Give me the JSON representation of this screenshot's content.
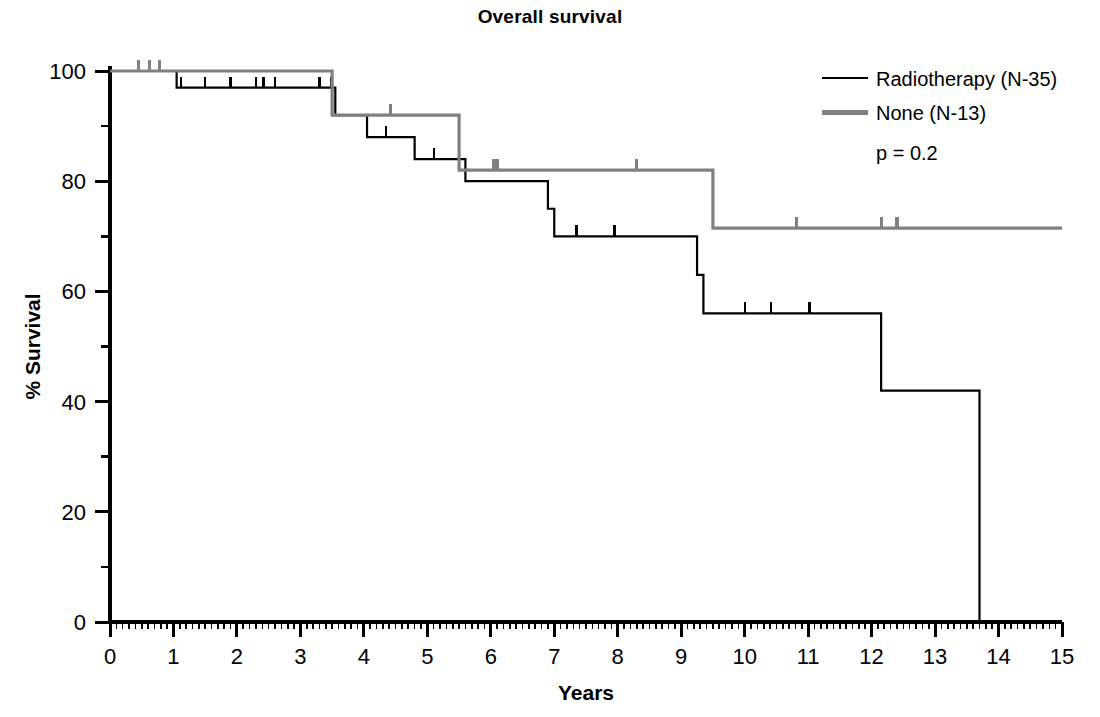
{
  "chart_data": {
    "type": "line",
    "subtype": "kaplan-meier-step",
    "title": "Overall survival",
    "xlabel": "Years",
    "ylabel": "% Survival",
    "xlim": [
      0,
      15
    ],
    "ylim": [
      0,
      100
    ],
    "grid": false,
    "x_major_ticks": [
      0,
      1,
      2,
      3,
      4,
      5,
      6,
      7,
      8,
      9,
      10,
      11,
      12,
      13,
      14,
      15
    ],
    "x_tick_labels": [
      "0",
      "1",
      "2",
      "3",
      "4",
      "5",
      "6",
      "7",
      "8",
      "9",
      "10",
      "11",
      "12",
      "13",
      "14",
      "15"
    ],
    "x_minor_tick_step": 0.1,
    "y_major_ticks": [
      0,
      20,
      40,
      60,
      80,
      100
    ],
    "y_tick_labels": [
      "0",
      "20",
      "40",
      "60",
      "80",
      "100"
    ],
    "y_minor_ticks": [
      10,
      30,
      50,
      70,
      90
    ],
    "legend_position": "top-right",
    "annotations": [
      {
        "name": "p-value",
        "text": "p = 0.2"
      }
    ],
    "series": [
      {
        "name": "Radiotherapy (N-35)",
        "label": "Radiotherapy (N-35)",
        "color": "#000000",
        "n": 35,
        "line_width": 2.2,
        "steps": [
          {
            "x": 0.0,
            "y": 100
          },
          {
            "x": 1.05,
            "y": 97
          },
          {
            "x": 3.55,
            "y": 92
          },
          {
            "x": 4.05,
            "y": 88
          },
          {
            "x": 4.8,
            "y": 84
          },
          {
            "x": 5.6,
            "y": 80
          },
          {
            "x": 6.9,
            "y": 75
          },
          {
            "x": 7.0,
            "y": 70
          },
          {
            "x": 9.25,
            "y": 63
          },
          {
            "x": 9.35,
            "y": 56
          },
          {
            "x": 12.15,
            "y": 42
          },
          {
            "x": 13.7,
            "y": 0
          }
        ],
        "censor_marks": [
          1.12,
          1.5,
          1.9,
          2.3,
          2.42,
          2.6,
          3.3,
          3.48,
          4.35,
          5.1,
          7.35,
          7.95,
          10.0,
          10.42,
          11.02
        ]
      },
      {
        "name": "None (N-13)",
        "label": "None (N-13)",
        "color": "#808080",
        "n": 13,
        "line_width": 3.2,
        "steps": [
          {
            "x": 0.0,
            "y": 100
          },
          {
            "x": 3.5,
            "y": 92
          },
          {
            "x": 5.5,
            "y": 82
          },
          {
            "x": 9.5,
            "y": 71.5
          },
          {
            "x": 15.0,
            "y": 71.5
          }
        ],
        "censor_marks": [
          0.45,
          0.62,
          0.78,
          4.42,
          6.05,
          6.1,
          8.3,
          10.82,
          12.15,
          12.4
        ]
      }
    ]
  },
  "legend": {
    "items": [
      {
        "label": "Radiotherapy (N-35)",
        "color": "#000000",
        "thickness": "thin"
      },
      {
        "label": "None (N-13)",
        "color": "#808080",
        "thickness": "thick"
      }
    ],
    "pvalue": "p = 0.2"
  },
  "axes": {
    "x_title": "Years",
    "y_title": "% Survival"
  }
}
